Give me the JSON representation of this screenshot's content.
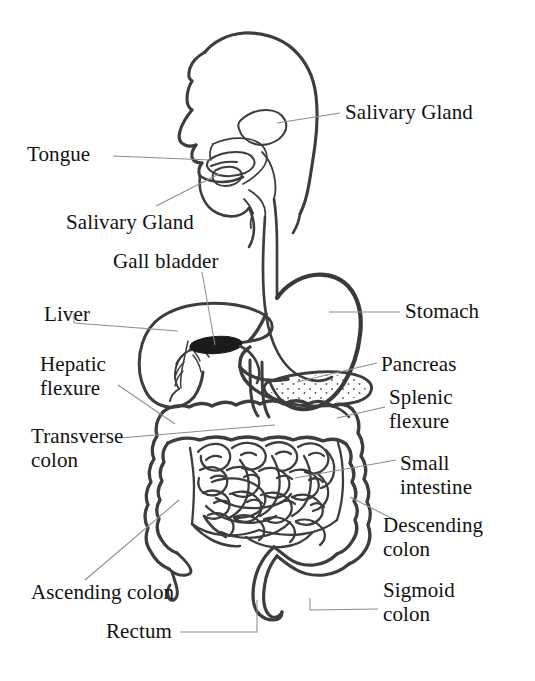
{
  "diagram": {
    "type": "labeled anatomical diagram",
    "background_color": "#ffffff",
    "ink_color": "#3a3a3a",
    "leader_line_color": "#8a8a8a",
    "labels": [
      {
        "id": "salivary-gland-upper",
        "text": "Salivary Gland",
        "x": 345,
        "y": 101,
        "align": "left",
        "anchor_x": 277,
        "anchor_y": 123,
        "leader": [
          [
            340,
            113
          ],
          [
            277,
            123
          ]
        ]
      },
      {
        "id": "tongue",
        "text": "Tongue",
        "x": 27,
        "y": 143,
        "align": "left",
        "anchor_x": 210,
        "anchor_y": 161,
        "leader": [
          [
            113,
            156
          ],
          [
            210,
            160
          ]
        ]
      },
      {
        "id": "salivary-gland-lower",
        "text": "Salivary Gland",
        "x": 66,
        "y": 211,
        "align": "left",
        "anchor_x": 219,
        "anchor_y": 173,
        "leader": [
          [
            156,
            206
          ],
          [
            219,
            174
          ]
        ]
      },
      {
        "id": "gall-bladder",
        "text": "Gall bladder",
        "x": 113,
        "y": 250,
        "align": "left",
        "anchor_x": 215,
        "anchor_y": 346,
        "leader": [
          [
            202,
            272
          ],
          [
            215,
            345
          ]
        ]
      },
      {
        "id": "liver",
        "text": "Liver",
        "x": 44,
        "y": 303,
        "align": "left",
        "anchor_x": 178,
        "anchor_y": 331,
        "leader": [
          [
            74,
            323
          ],
          [
            178,
            331
          ]
        ]
      },
      {
        "id": "stomach",
        "text": "Stomach",
        "x": 405,
        "y": 300,
        "align": "left",
        "anchor_x": 329,
        "anchor_y": 312,
        "leader": [
          [
            400,
            312
          ],
          [
            329,
            312
          ]
        ]
      },
      {
        "id": "hepatic-flexure",
        "text": "Hepatic\nflexure",
        "x": 40,
        "y": 352,
        "align": "left",
        "anchor_x": 175,
        "anchor_y": 424,
        "leader": [
          [
            118,
            385
          ],
          [
            175,
            424
          ]
        ]
      },
      {
        "id": "pancreas",
        "text": "Pancreas",
        "x": 381,
        "y": 353,
        "align": "left",
        "anchor_x": 297,
        "anchor_y": 382,
        "leader": [
          [
            377,
            363
          ],
          [
            297,
            382
          ]
        ]
      },
      {
        "id": "splenic-flexure",
        "text": "Splenic\nflexure",
        "x": 389,
        "y": 385,
        "align": "left",
        "anchor_x": 337,
        "anchor_y": 419,
        "leader": [
          [
            385,
            407
          ],
          [
            337,
            418
          ]
        ]
      },
      {
        "id": "transverse-colon",
        "text": "Transverse\ncolon",
        "x": 31,
        "y": 424,
        "align": "left",
        "anchor_x": 275,
        "anchor_y": 425,
        "leader": [
          [
            120,
            438
          ],
          [
            275,
            425
          ]
        ]
      },
      {
        "id": "small-intestine",
        "text": "Small\nintestine",
        "x": 400,
        "y": 451,
        "align": "left",
        "anchor_x": 295,
        "anchor_y": 478,
        "leader": [
          [
            396,
            460
          ],
          [
            295,
            478
          ]
        ]
      },
      {
        "id": "descending-colon",
        "text": "Descending\ncolon",
        "x": 383,
        "y": 513,
        "align": "left",
        "anchor_x": 350,
        "anchor_y": 497,
        "leader": [
          [
            393,
            519
          ],
          [
            350,
            497
          ]
        ]
      },
      {
        "id": "ascending-colon",
        "text": "Ascending colon",
        "x": 31,
        "y": 581,
        "align": "left",
        "anchor_x": 179,
        "anchor_y": 500,
        "leader": [
          [
            85,
            580
          ],
          [
            179,
            500
          ]
        ]
      },
      {
        "id": "sigmoid-colon",
        "text": "Sigmoid\ncolon",
        "x": 383,
        "y": 578,
        "align": "left",
        "anchor_x": 310,
        "anchor_y": 598,
        "leader": [
          [
            378,
            609
          ],
          [
            310,
            610
          ],
          [
            310,
            598
          ]
        ]
      },
      {
        "id": "rectum",
        "text": "Rectum",
        "x": 106,
        "y": 620,
        "align": "left",
        "anchor_x": 257,
        "anchor_y": 600,
        "leader": [
          [
            180,
            632
          ],
          [
            257,
            632
          ],
          [
            257,
            600
          ]
        ]
      }
    ],
    "organs": [
      "head-profile",
      "tongue",
      "salivary-gland-parotid",
      "salivary-gland-sublingual",
      "esophagus",
      "stomach",
      "liver",
      "gall-bladder",
      "bile-duct",
      "duodenum",
      "pancreas",
      "transverse-colon",
      "ascending-colon",
      "descending-colon",
      "sigmoid-colon",
      "rectum",
      "small-intestine",
      "cecum-appendix"
    ]
  }
}
